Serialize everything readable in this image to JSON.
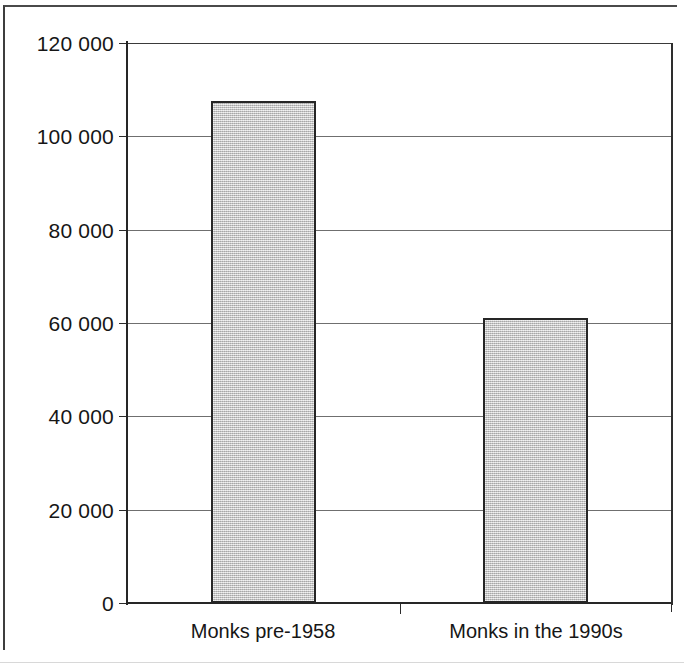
{
  "chart_data": {
    "type": "bar",
    "title": "",
    "subtitle": "",
    "xlabel": "",
    "ylabel": "",
    "categories": [
      "Monks pre-1958",
      "Monks in the 1990s"
    ],
    "values": [
      107500,
      61000
    ],
    "series": [
      {
        "name": "Monks",
        "values": [
          107500,
          61000
        ]
      }
    ],
    "ylim": [
      0,
      120000
    ],
    "y_ticks": [
      0,
      20000,
      40000,
      60000,
      80000,
      100000,
      120000
    ],
    "y_tick_labels": [
      "0",
      "20 000",
      "40 000",
      "60 000",
      "80 000",
      "100 000",
      "120 000"
    ],
    "grid": "horizontal",
    "legend": "none",
    "bar_fill_color": "#c9c9c9",
    "bar_border_color": "#262626",
    "axis_color": "#262626",
    "gridline_color": "#6f6f6f",
    "background_color": "#ffffff"
  },
  "axes": {
    "y": {
      "ticks": [
        {
          "label": "120 000",
          "value": 120000
        },
        {
          "label": "100 000",
          "value": 100000
        },
        {
          "label": "80 000",
          "value": 80000
        },
        {
          "label": "60 000",
          "value": 60000
        },
        {
          "label": "40 000",
          "value": 40000
        },
        {
          "label": "20 000",
          "value": 20000
        },
        {
          "label": "0",
          "value": 0
        }
      ]
    },
    "x": {
      "categories": [
        {
          "label": "Monks pre-1958"
        },
        {
          "label": "Monks in the 1990s"
        }
      ]
    }
  }
}
